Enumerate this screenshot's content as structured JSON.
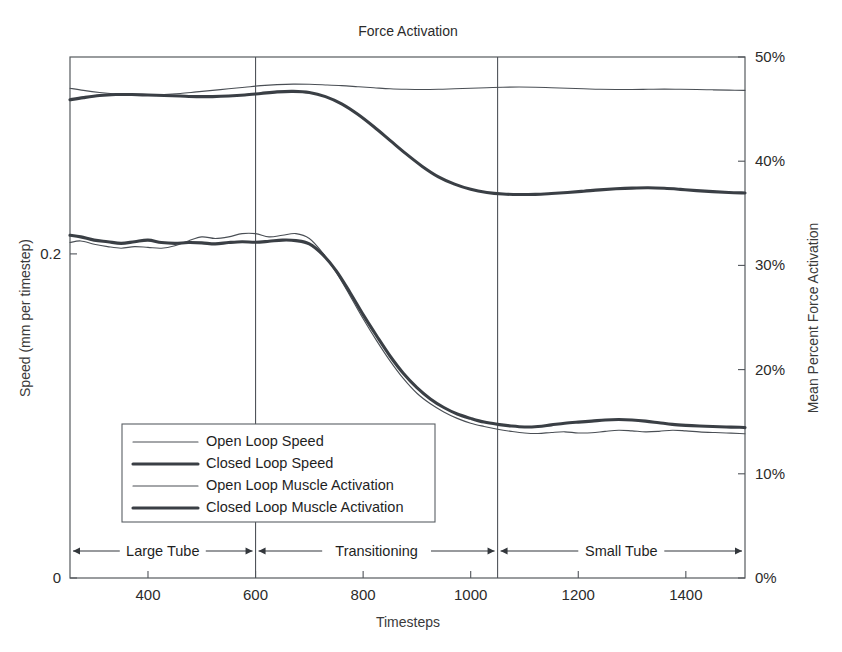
{
  "chart_data": {
    "type": "line",
    "title": "Force Activation",
    "xlabel": "Timesteps",
    "ylabel_left": "Speed (mm per timestep)",
    "ylabel_right": "Mean Percent Force Activation",
    "xlim": [
      255,
      1510
    ],
    "xticks": [
      400,
      600,
      800,
      1000,
      1200,
      1400
    ],
    "xticklabels": [
      "400",
      "600",
      "800",
      "1000",
      "1200",
      "1400"
    ],
    "ylim_left": [
      0,
      0.3215
    ],
    "yticks_left": [
      0,
      0.2
    ],
    "yticklabels_left": [
      "0",
      "0.2"
    ],
    "ylim_right": [
      0,
      50
    ],
    "yticks_right": [
      0,
      10,
      20,
      30,
      40,
      50
    ],
    "yticklabels_right": [
      "0%",
      "10%",
      "20%",
      "30%",
      "40%",
      "50%"
    ],
    "grid": false,
    "legend_position": "lower-left",
    "legend": [
      "Open Loop Speed",
      "Closed Loop Speed",
      "Open Loop Muscle Activation",
      "Closed Loop Muscle Activation"
    ],
    "annotations": [
      {
        "label": "Large Tube",
        "x_start": 255,
        "x_end": 600
      },
      {
        "label": "Transitioning",
        "x_start": 600,
        "x_end": 1050
      },
      {
        "label": "Small Tube",
        "x_start": 1050,
        "x_end": 1510
      }
    ],
    "region_dividers": [
      600,
      1050
    ],
    "series": [
      {
        "name": "Open Loop Speed",
        "axis": "left",
        "style": "thin",
        "x": [
          255,
          275,
          300,
          325,
          350,
          375,
          400,
          425,
          450,
          475,
          500,
          525,
          550,
          575,
          600,
          625,
          650,
          675,
          700,
          725,
          750,
          775,
          800,
          825,
          850,
          875,
          900,
          925,
          950,
          975,
          1000,
          1025,
          1050,
          1075,
          1100,
          1125,
          1150,
          1175,
          1200,
          1225,
          1250,
          1275,
          1300,
          1325,
          1350,
          1375,
          1400,
          1425,
          1450,
          1475,
          1500,
          1510
        ],
        "y": [
          0.207,
          0.208,
          0.206,
          0.2045,
          0.2035,
          0.2045,
          0.204,
          0.2035,
          0.205,
          0.208,
          0.2105,
          0.2095,
          0.2105,
          0.2125,
          0.2125,
          0.2105,
          0.2115,
          0.2125,
          0.2095,
          0.2005,
          0.1885,
          0.1745,
          0.16,
          0.1465,
          0.134,
          0.123,
          0.114,
          0.1075,
          0.1025,
          0.0985,
          0.0955,
          0.0935,
          0.0918,
          0.0905,
          0.0895,
          0.0892,
          0.0898,
          0.0902,
          0.0895,
          0.0896,
          0.0905,
          0.0912,
          0.0908,
          0.0902,
          0.0905,
          0.0912,
          0.0908,
          0.0902,
          0.0898,
          0.0895,
          0.0892,
          0.089
        ]
      },
      {
        "name": "Closed Loop Speed",
        "axis": "left",
        "style": "thick",
        "x": [
          255,
          275,
          300,
          325,
          350,
          375,
          400,
          425,
          450,
          475,
          500,
          525,
          550,
          575,
          600,
          625,
          650,
          675,
          700,
          725,
          750,
          775,
          800,
          825,
          850,
          875,
          900,
          925,
          950,
          975,
          1000,
          1025,
          1050,
          1075,
          1100,
          1125,
          1150,
          1175,
          1200,
          1225,
          1250,
          1275,
          1300,
          1325,
          1350,
          1375,
          1400,
          1425,
          1450,
          1475,
          1500,
          1510
        ],
        "y": [
          0.2115,
          0.2105,
          0.2085,
          0.2075,
          0.2065,
          0.2075,
          0.2085,
          0.207,
          0.2065,
          0.207,
          0.2068,
          0.2062,
          0.207,
          0.2075,
          0.2072,
          0.2078,
          0.2085,
          0.2082,
          0.2062,
          0.1995,
          0.1895,
          0.1765,
          0.1625,
          0.1495,
          0.137,
          0.1262,
          0.1175,
          0.1105,
          0.1052,
          0.1012,
          0.0985,
          0.0962,
          0.0948,
          0.0938,
          0.0932,
          0.0935,
          0.0945,
          0.0955,
          0.0962,
          0.0968,
          0.0975,
          0.0978,
          0.0975,
          0.0968,
          0.0958,
          0.0948,
          0.0942,
          0.0938,
          0.0935,
          0.0932,
          0.093,
          0.0928
        ]
      },
      {
        "name": "Open Loop Muscle Activation",
        "axis": "right",
        "style": "thin",
        "x": [
          255,
          280,
          310,
          340,
          370,
          400,
          430,
          460,
          490,
          520,
          550,
          580,
          610,
          640,
          670,
          700,
          730,
          760,
          790,
          820,
          850,
          880,
          910,
          940,
          970,
          1000,
          1030,
          1060,
          1090,
          1120,
          1150,
          1180,
          1210,
          1240,
          1270,
          1300,
          1330,
          1360,
          1390,
          1420,
          1450,
          1480,
          1510
        ],
        "y": [
          47.0,
          46.8,
          46.6,
          46.45,
          46.35,
          46.35,
          46.4,
          46.5,
          46.65,
          46.8,
          46.95,
          47.1,
          47.25,
          47.35,
          47.4,
          47.38,
          47.32,
          47.25,
          47.15,
          47.05,
          46.95,
          46.9,
          46.88,
          46.9,
          46.95,
          47.0,
          47.05,
          47.1,
          47.12,
          47.1,
          47.05,
          47.0,
          46.95,
          46.9,
          46.88,
          46.88,
          46.9,
          46.92,
          46.9,
          46.88,
          46.85,
          46.82,
          46.8
        ]
      },
      {
        "name": "Closed Loop Muscle Activation",
        "axis": "right",
        "style": "thick",
        "x": [
          255,
          280,
          310,
          340,
          370,
          400,
          430,
          460,
          490,
          520,
          550,
          580,
          610,
          640,
          670,
          700,
          730,
          760,
          790,
          820,
          850,
          880,
          910,
          940,
          970,
          1000,
          1030,
          1060,
          1090,
          1120,
          1150,
          1180,
          1210,
          1240,
          1270,
          1300,
          1330,
          1360,
          1390,
          1420,
          1450,
          1480,
          1510
        ],
        "y": [
          45.9,
          46.1,
          46.3,
          46.4,
          46.4,
          46.35,
          46.3,
          46.25,
          46.2,
          46.2,
          46.25,
          46.35,
          46.5,
          46.65,
          46.7,
          46.6,
          46.2,
          45.5,
          44.5,
          43.3,
          42.0,
          40.7,
          39.5,
          38.5,
          37.8,
          37.3,
          37.0,
          36.85,
          36.8,
          36.82,
          36.9,
          37.0,
          37.12,
          37.25,
          37.35,
          37.42,
          37.45,
          37.4,
          37.3,
          37.18,
          37.08,
          37.0,
          36.95
        ]
      }
    ]
  }
}
